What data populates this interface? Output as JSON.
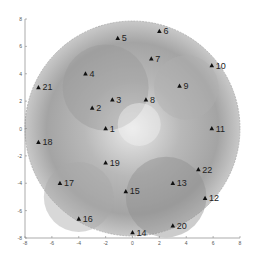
{
  "chart_data": {
    "type": "scatter",
    "title": "",
    "xlabel": "",
    "ylabel": "",
    "xlim": [
      -8,
      8
    ],
    "ylim": [
      -8,
      8
    ],
    "xticks": [
      -8,
      -6,
      -4,
      -2,
      0,
      2,
      4,
      6,
      8
    ],
    "yticks": [
      -8,
      -6,
      -4,
      -2,
      0,
      2,
      4,
      6,
      8
    ],
    "grid": false,
    "background": "circular grayscale intensity map, radius 8",
    "marker": "triangle",
    "points": [
      {
        "label": "1",
        "x": -2.0,
        "y": 0.0
      },
      {
        "label": "2",
        "x": -3.0,
        "y": 1.5
      },
      {
        "label": "3",
        "x": -1.5,
        "y": 2.1
      },
      {
        "label": "4",
        "x": -3.5,
        "y": 4.0
      },
      {
        "label": "5",
        "x": -1.1,
        "y": 6.6
      },
      {
        "label": "6",
        "x": 2.0,
        "y": 7.1
      },
      {
        "label": "7",
        "x": 1.4,
        "y": 5.1
      },
      {
        "label": "8",
        "x": 1.0,
        "y": 2.1
      },
      {
        "label": "9",
        "x": 3.5,
        "y": 3.1
      },
      {
        "label": "10",
        "x": 5.9,
        "y": 4.6
      },
      {
        "label": "11",
        "x": 5.9,
        "y": 0.0
      },
      {
        "label": "12",
        "x": 5.4,
        "y": -5.1
      },
      {
        "label": "13",
        "x": 3.0,
        "y": -4.0
      },
      {
        "label": "14",
        "x": 0.0,
        "y": -7.6
      },
      {
        "label": "15",
        "x": -0.5,
        "y": -4.6
      },
      {
        "label": "16",
        "x": -4.0,
        "y": -6.6
      },
      {
        "label": "17",
        "x": -5.4,
        "y": -4.0
      },
      {
        "label": "18",
        "x": -7.0,
        "y": -1.0
      },
      {
        "label": "19",
        "x": -2.0,
        "y": -2.5
      },
      {
        "label": "20",
        "x": 3.0,
        "y": -7.1
      },
      {
        "label": "21",
        "x": -7.0,
        "y": 3.0
      },
      {
        "label": "22",
        "x": 4.9,
        "y": -3.0
      }
    ]
  }
}
